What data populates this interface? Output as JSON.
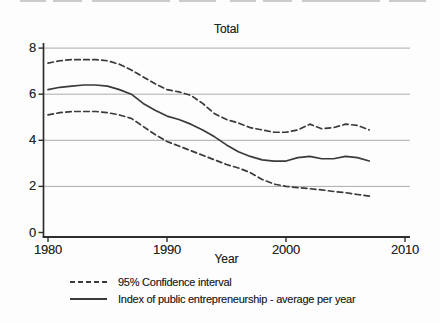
{
  "figure": {
    "title": "Total",
    "x_axis_title": "Year",
    "legend": [
      {
        "style": "dashed",
        "label": "95% Confidence interval"
      },
      {
        "style": "solid",
        "label": "Index of public entrepreneurship - average per year"
      }
    ]
  },
  "chart_data": {
    "type": "line",
    "title": "Total",
    "xlabel": "Year",
    "ylabel": "",
    "xlim": [
      1979.6,
      2010.4
    ],
    "ylim": [
      0,
      8
    ],
    "xticks": [
      1980,
      1990,
      2000,
      2010
    ],
    "yticks": [
      0,
      2,
      4,
      6,
      8
    ],
    "grid": "horizontal gridlines at y = 2,4,6,8",
    "legend_position": "below-left",
    "x": [
      1980,
      1981,
      1982,
      1983,
      1984,
      1985,
      1986,
      1987,
      1988,
      1989,
      1990,
      1991,
      1992,
      1993,
      1994,
      1995,
      1996,
      1997,
      1998,
      1999,
      2000,
      2001,
      2002,
      2003,
      2004,
      2005,
      2006,
      2007
    ],
    "series": [
      {
        "name": "95% Confidence interval (upper)",
        "style": "dashed",
        "values": [
          7.35,
          7.45,
          7.5,
          7.5,
          7.5,
          7.45,
          7.3,
          7.05,
          6.75,
          6.45,
          6.2,
          6.1,
          5.95,
          5.6,
          5.15,
          4.9,
          4.75,
          4.55,
          4.45,
          4.35,
          4.35,
          4.45,
          4.7,
          4.5,
          4.55,
          4.7,
          4.65,
          4.45
        ]
      },
      {
        "name": "Index of public entrepreneurship - average per year",
        "style": "solid",
        "values": [
          6.2,
          6.3,
          6.35,
          6.4,
          6.4,
          6.35,
          6.2,
          6.0,
          5.6,
          5.3,
          5.05,
          4.9,
          4.7,
          4.45,
          4.15,
          3.8,
          3.5,
          3.3,
          3.15,
          3.1,
          3.1,
          3.25,
          3.3,
          3.2,
          3.2,
          3.3,
          3.25,
          3.1
        ]
      },
      {
        "name": "95% Confidence interval (lower)",
        "style": "dashed",
        "values": [
          5.1,
          5.2,
          5.25,
          5.25,
          5.25,
          5.2,
          5.1,
          4.95,
          4.6,
          4.25,
          3.95,
          3.75,
          3.55,
          3.35,
          3.15,
          2.95,
          2.8,
          2.6,
          2.3,
          2.1,
          2.0,
          1.95,
          1.9,
          1.85,
          1.78,
          1.73,
          1.65,
          1.58
        ]
      }
    ],
    "colors": {
      "line": "#3a3a3a",
      "grid": "#ababab",
      "axis": "#2e2e2e",
      "text": "#262626",
      "background": "#fdfdfd",
      "scan_artifact": "#c3c3c3"
    }
  }
}
